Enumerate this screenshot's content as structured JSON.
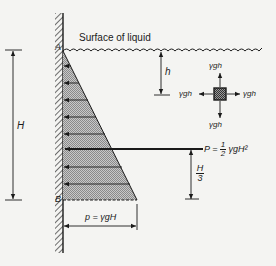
{
  "diagram": {
    "surface_label": "Surface of liquid",
    "point_top": "A",
    "point_bottom": "B",
    "depth_total_label": "H",
    "depth_local_label": "h",
    "element_pressures": {
      "top": "γgh",
      "bottom": "γgh",
      "left": "γgh",
      "right": "γgh"
    },
    "resultant": {
      "lhs": "P = ",
      "frac_num": "1",
      "frac_den": "2",
      "rhs": " γgH²"
    },
    "resultant_height": {
      "num": "H",
      "den": "3"
    },
    "base_pressure_label": "p = γgH",
    "colors": {
      "ink": "#1a1a1a",
      "background": "#f4f4f2",
      "pressure_fill": "#b4b4b4"
    }
  }
}
